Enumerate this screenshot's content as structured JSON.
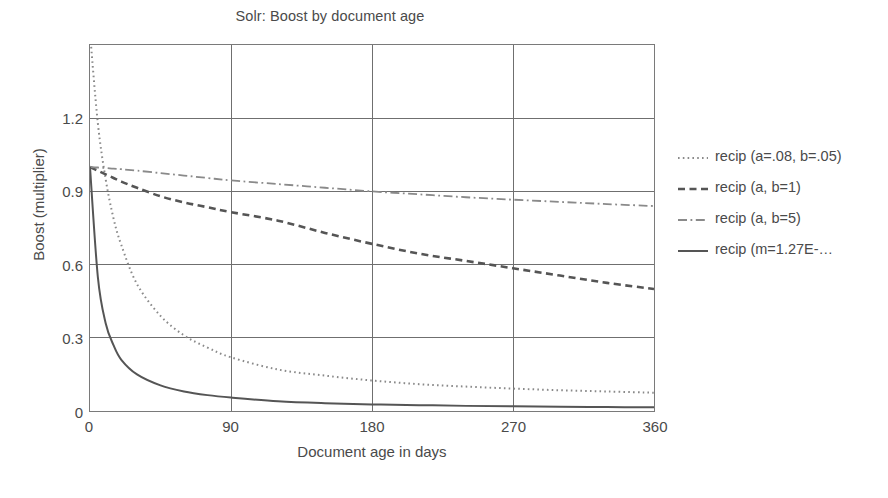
{
  "chart_data": {
    "type": "line",
    "title": "Solr: Boost by document age",
    "xlabel": "Document age in days",
    "ylabel": "Boost (multiplier)",
    "xlim": [
      0,
      360
    ],
    "ylim": [
      0,
      1.5
    ],
    "xticks": [
      "0",
      "90",
      "180",
      "270",
      "360"
    ],
    "xtick_values": [
      0,
      90,
      180,
      270,
      360
    ],
    "yticks": [
      "0",
      "0.3",
      "0.6",
      "0.9",
      "1.2"
    ],
    "ytick_values": [
      0,
      0.3,
      0.6,
      0.9,
      1.2
    ],
    "grid": true,
    "legend_position": "right",
    "x": [
      0,
      5,
      10,
      15,
      20,
      30,
      45,
      60,
      75,
      90,
      120,
      150,
      180,
      210,
      240,
      270,
      300,
      330,
      360
    ],
    "series": [
      {
        "name": "recip (a=.08, b=.05)",
        "style": "dotted",
        "color": "#8a8a8a",
        "values": [
          1.55,
          1.18,
          0.95,
          0.79,
          0.68,
          0.52,
          0.39,
          0.31,
          0.26,
          0.22,
          0.17,
          0.145,
          0.125,
          0.11,
          0.1,
          0.092,
          0.085,
          0.08,
          0.075
        ]
      },
      {
        "name": "recip (a, b=1)",
        "style": "dashed",
        "color": "#555555",
        "values": [
          1.0,
          0.985,
          0.97,
          0.955,
          0.94,
          0.915,
          0.88,
          0.855,
          0.835,
          0.815,
          0.78,
          0.73,
          0.685,
          0.645,
          0.615,
          0.585,
          0.555,
          0.525,
          0.5
        ]
      },
      {
        "name": "recip (a, b=5)",
        "style": "dashdot",
        "color": "#8a8a8a",
        "values": [
          1.0,
          0.998,
          0.996,
          0.993,
          0.991,
          0.985,
          0.975,
          0.965,
          0.955,
          0.945,
          0.93,
          0.915,
          0.9,
          0.888,
          0.876,
          0.866,
          0.857,
          0.848,
          0.84
        ]
      },
      {
        "name": "recip (m=1.27E-…",
        "style": "solid",
        "color": "#555555",
        "values": [
          1.0,
          0.55,
          0.36,
          0.27,
          0.21,
          0.15,
          0.105,
          0.08,
          0.065,
          0.055,
          0.04,
          0.032,
          0.027,
          0.024,
          0.021,
          0.019,
          0.017,
          0.016,
          0.015
        ]
      }
    ]
  },
  "legend": {
    "entries": [
      {
        "label": "recip (a=.08, b=.05)"
      },
      {
        "label": "recip (a, b=1)"
      },
      {
        "label": "recip (a, b=5)"
      },
      {
        "label": "recip (m=1.27E-…"
      }
    ]
  },
  "colors": {
    "axis": "#7a7a7a",
    "grid": "#6e6e6e",
    "text": "#4a4a4a",
    "light_series": "#8a8a8a",
    "dark_series": "#555555",
    "background": "#ffffff"
  }
}
